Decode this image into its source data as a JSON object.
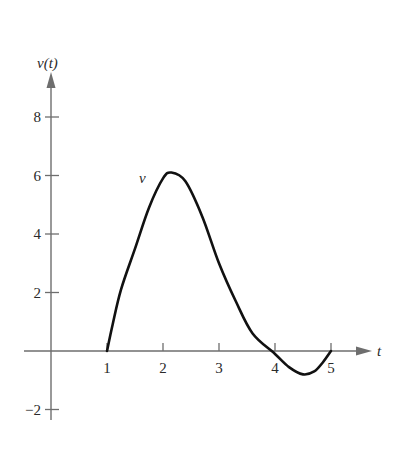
{
  "chart_data": {
    "type": "line",
    "title": "",
    "xlabel": "t",
    "ylabel": "v(t)",
    "curve_label": "v",
    "xlim": [
      0,
      5.6
    ],
    "ylim": [
      -2.9,
      9
    ],
    "x_ticks": [
      1,
      2,
      3,
      4,
      5
    ],
    "y_ticks": [
      -2,
      2,
      4,
      6,
      8
    ],
    "grid": false,
    "legend": "none",
    "series": [
      {
        "name": "v",
        "x": [
          1.0,
          1.1,
          1.25,
          1.5,
          1.75,
          2.0,
          2.15,
          2.4,
          2.7,
          3.0,
          3.3,
          3.6,
          4.0,
          4.25,
          4.5,
          4.7,
          4.85,
          5.0
        ],
        "values": [
          0.0,
          0.9,
          2.1,
          3.5,
          4.9,
          5.9,
          6.1,
          5.8,
          4.6,
          3.0,
          1.7,
          0.6,
          -0.1,
          -0.55,
          -0.8,
          -0.7,
          -0.4,
          0.0
        ]
      }
    ]
  },
  "labels": {
    "y_axis": "v(t)",
    "x_axis": "t",
    "curve": "v",
    "x_tick_labels": [
      "1",
      "2",
      "3",
      "4",
      "5"
    ],
    "y_tick_labels": [
      "8",
      "6",
      "4",
      "2",
      "−2"
    ]
  }
}
